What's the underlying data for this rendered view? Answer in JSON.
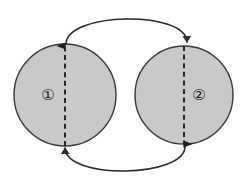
{
  "diagram": {
    "type": "node-arc-diagram",
    "background_color": "#ffffff",
    "stroke_color": "#2b2b2b",
    "node_fill_color": "#c9c9c9",
    "node_stroke_color": "#3a3a3a",
    "dashed_stroke_color": "#1f1f1f",
    "nodes": [
      {
        "id": "node-1",
        "label": "①",
        "label_plain": "1",
        "cx": 65,
        "cy": 95,
        "r": 51,
        "label_x": 48,
        "label_y": 95
      },
      {
        "id": "node-2",
        "label": "②",
        "label_plain": "2",
        "cx": 184,
        "cy": 95,
        "r": 49,
        "label_x": 199,
        "label_y": 95
      }
    ],
    "dashed_arrows": [
      {
        "id": "dashed-arrow-node-1",
        "direction": "up",
        "x": 65,
        "y_start": 146,
        "y_end": 46
      },
      {
        "id": "dashed-arrow-node-2",
        "direction": "down",
        "x": 184,
        "y_start": 46,
        "y_end": 144
      }
    ],
    "arcs": [
      {
        "id": "top-arc",
        "from": "node-1",
        "to": "node-2",
        "direction": "left-to-right",
        "position": "top",
        "path": "M 66,44 C 66,12 186,10 187,42"
      },
      {
        "id": "bottom-arc",
        "from": "node-2",
        "to": "node-1",
        "direction": "right-to-left",
        "position": "bottom",
        "path": "M 185,146 C 186,178 66,180 65,148"
      }
    ]
  }
}
